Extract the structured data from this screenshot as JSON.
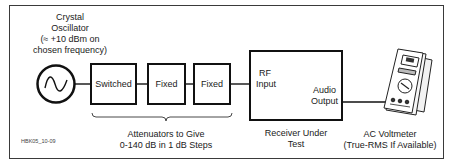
{
  "oscillator": {
    "title_line1": "Crystal",
    "title_line2": "Oscillator",
    "title_line3": "(≈ +10 dBm on",
    "title_line4": "chosen frequency)"
  },
  "attenuators": {
    "boxes": [
      "Switched",
      "Fixed",
      "Fixed"
    ],
    "caption_line1": "Attenuators to Give",
    "caption_line2": "0-140 dB in 1 dB Steps"
  },
  "receiver": {
    "input_line1": "RF",
    "input_line2": "Input",
    "output_line1": "Audio",
    "output_line2": "Output",
    "caption_line1": "Receiver Under",
    "caption_line2": "Test"
  },
  "voltmeter": {
    "caption_line1": "AC Voltmeter",
    "caption_line2": "(True-RMS If Available)"
  },
  "figure_id": "HBK05_10-09",
  "colors": {
    "line": "#111111",
    "frame": "#3a3a3a",
    "background": "#ffffff"
  }
}
